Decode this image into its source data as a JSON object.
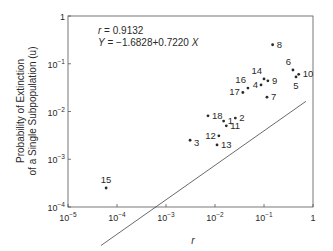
{
  "chart_data": {
    "type": "scatter",
    "title": "",
    "xlabel": "r",
    "ylabel_line1": "Probability of Extinction",
    "ylabel_line2": "of a Single Subpopulation (u)",
    "xscale": "log",
    "yscale": "log",
    "xlim": [
      1e-05,
      1
    ],
    "ylim": [
      0.0001,
      1
    ],
    "grid": false,
    "x_ticks": [
      {
        "value": 1e-05,
        "base": "10",
        "exp": "−5"
      },
      {
        "value": 0.0001,
        "base": "10",
        "exp": "−4"
      },
      {
        "value": 0.001,
        "base": "10",
        "exp": "−3"
      },
      {
        "value": 0.01,
        "base": "10",
        "exp": "−2"
      },
      {
        "value": 0.1,
        "base": "10",
        "exp": "−1"
      },
      {
        "value": 1,
        "base": "1",
        "exp": ""
      }
    ],
    "y_ticks": [
      {
        "value": 0.0001,
        "base": "10",
        "exp": "−4"
      },
      {
        "value": 0.001,
        "base": "10",
        "exp": "−3"
      },
      {
        "value": 0.01,
        "base": "10",
        "exp": "−2"
      },
      {
        "value": 0.1,
        "base": "10",
        "exp": "−1"
      },
      {
        "value": 1,
        "base": "1",
        "exp": ""
      }
    ],
    "annotations": {
      "r_label": "r",
      "r_value": " = 0.9132",
      "eq_label": "Y",
      "eq_value": " = −1.6828+0.7220 ",
      "eq_x": "X"
    },
    "regression": {
      "intercept": -1.6828,
      "slope": 0.722,
      "x_range": [
        4.7e-05,
        0.72
      ]
    },
    "points": [
      {
        "label": "1",
        "x": 0.015,
        "y": 0.0063,
        "label_pos": "right"
      },
      {
        "label": "2",
        "x": 0.026,
        "y": 0.0073,
        "label_pos": "right"
      },
      {
        "label": "3",
        "x": 0.0031,
        "y": 0.0025,
        "label_pos": "right-below"
      },
      {
        "label": "4",
        "x": 0.087,
        "y": 0.036,
        "label_pos": "left"
      },
      {
        "label": "5",
        "x": 0.45,
        "y": 0.053,
        "label_pos": "below"
      },
      {
        "label": "6",
        "x": 0.39,
        "y": 0.074,
        "label_pos": "above-left"
      },
      {
        "label": "7",
        "x": 0.115,
        "y": 0.02,
        "label_pos": "right"
      },
      {
        "label": "8",
        "x": 0.15,
        "y": 0.25,
        "label_pos": "right"
      },
      {
        "label": "9",
        "x": 0.12,
        "y": 0.044,
        "label_pos": "right"
      },
      {
        "label": "10",
        "x": 0.51,
        "y": 0.06,
        "label_pos": "right"
      },
      {
        "label": "11",
        "x": 0.017,
        "y": 0.005,
        "label_pos": "right"
      },
      {
        "label": "12",
        "x": 0.012,
        "y": 0.0031,
        "label_pos": "left"
      },
      {
        "label": "13",
        "x": 0.011,
        "y": 0.002,
        "label_pos": "right"
      },
      {
        "label": "14",
        "x": 0.1,
        "y": 0.048,
        "label_pos": "above-left"
      },
      {
        "label": "15",
        "x": 6e-05,
        "y": 0.00025,
        "label_pos": "above"
      },
      {
        "label": "16",
        "x": 0.047,
        "y": 0.031,
        "label_pos": "above-left"
      },
      {
        "label": "17",
        "x": 0.037,
        "y": 0.025,
        "label_pos": "left"
      },
      {
        "label": "18",
        "x": 0.0072,
        "y": 0.0081,
        "label_pos": "right"
      }
    ],
    "colors": {
      "ink": "#2a2a2a",
      "background": "#ffffff"
    }
  }
}
